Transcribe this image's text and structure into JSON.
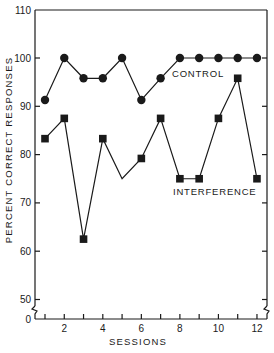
{
  "chart_data": {
    "type": "line",
    "title": "",
    "xlabel": "SESSIONS",
    "ylabel": "PERCENT CORRECT RESPONSES",
    "x": [
      1,
      2,
      3,
      4,
      5,
      6,
      7,
      8,
      9,
      10,
      11,
      12
    ],
    "x_tick_labels": [
      "2",
      "4",
      "6",
      "8",
      "10",
      "12"
    ],
    "x_tick_label_positions": [
      2,
      4,
      6,
      8,
      10,
      12
    ],
    "y_tick_labels": [
      "0",
      "50",
      "60",
      "70",
      "80",
      "90",
      "100",
      "110"
    ],
    "ylim": [
      50,
      110
    ],
    "y_axis_break": "between 0 and 50",
    "grid": false,
    "legend": "inline labels",
    "series": [
      {
        "name": "CONTROL",
        "marker": "circle",
        "values": [
          91.3,
          100,
          95.8,
          95.8,
          100,
          91.3,
          95.8,
          100,
          100,
          100,
          100,
          100
        ]
      },
      {
        "name": "INTERFERENCE",
        "marker": "square",
        "values": [
          83.3,
          87.5,
          62.5,
          83.3,
          75,
          79.2,
          87.5,
          75,
          75,
          87.5,
          95.8,
          75
        ],
        "unmarked_points": [
          5
        ]
      }
    ]
  },
  "labels": {
    "control": "CONTROL",
    "interference": "INTERFERENCE",
    "xlabel": "SESSIONS",
    "ylabel": "PERCENT CORRECT RESPONSES"
  },
  "colors": {
    "ink": "#1a1a1a",
    "background": "#ffffff"
  }
}
